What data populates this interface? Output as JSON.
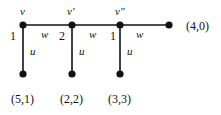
{
  "diagram": {
    "nodes": [
      {
        "id": "v",
        "label": "v",
        "weight": "1",
        "x": 23,
        "y": 25
      },
      {
        "id": "v1",
        "label": "v′",
        "weight": "2",
        "x": 72,
        "y": 25
      },
      {
        "id": "v2",
        "label": "v″",
        "weight": "1",
        "x": 120,
        "y": 25
      },
      {
        "id": "end",
        "label": "(4,0)",
        "x": 169,
        "y": 25
      },
      {
        "id": "b1",
        "label": "(5,1)",
        "x": 23,
        "y": 74
      },
      {
        "id": "b2",
        "label": "(2,2)",
        "x": 72,
        "y": 74
      },
      {
        "id": "b3",
        "label": "(3,3)",
        "x": 120,
        "y": 74
      }
    ],
    "edges": [
      {
        "from": "v",
        "to": "v1",
        "label": "w"
      },
      {
        "from": "v1",
        "to": "v2",
        "label": "w"
      },
      {
        "from": "v2",
        "to": "end",
        "label": "w"
      },
      {
        "from": "v",
        "to": "b1",
        "label": "u"
      },
      {
        "from": "v1",
        "to": "b2",
        "label": "u"
      },
      {
        "from": "v2",
        "to": "b3",
        "label": "u"
      }
    ],
    "top_labels": [
      "v",
      "v′",
      "v″"
    ],
    "weights": [
      "1",
      "2",
      "1"
    ],
    "h_edge_label": "w",
    "v_edge_label": "u",
    "end_label": "(4,0)",
    "bottom_labels": [
      "(5,1)",
      "(2,2)",
      "(3,3)"
    ],
    "colors": {
      "line": "#111111",
      "node": "#111111",
      "background": "#ffffff"
    }
  }
}
